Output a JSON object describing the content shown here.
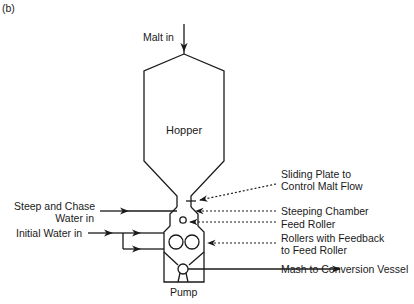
{
  "figure": {
    "panel_label": "(b)",
    "labels": {
      "malt_in": "Malt in",
      "hopper": "Hopper",
      "steep_water_line1": "Steep and Chase",
      "steep_water_line2": "Water in",
      "initial_water": "Initial Water in",
      "pump": "Pump",
      "sliding_plate_line1": "Sliding Plate to",
      "sliding_plate_line2": "Control Malt Flow",
      "steeping_chamber": "Steeping Chamber",
      "feed_roller": "Feed Roller",
      "rollers_line1": "Rollers with Feedback",
      "rollers_line2": "to Feed Roller",
      "mash_out": "Mash to Conversion Vessel"
    },
    "colors": {
      "stroke": "#1a1a1a",
      "background": "#ffffff"
    }
  }
}
